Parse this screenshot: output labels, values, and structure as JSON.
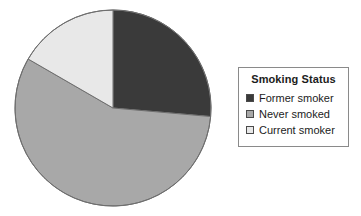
{
  "chart_data": {
    "type": "pie",
    "title": "",
    "legend_title": "Smoking Status",
    "legend_position": "right",
    "categories": [
      "Former smoker",
      "Never smoked",
      "Current smoker"
    ],
    "values": [
      26,
      57,
      17
    ],
    "unit": "percent",
    "slice_colors": [
      "#3a3a3a",
      "#a8a8a8",
      "#e8e8e8"
    ],
    "start_angle_deg": 0,
    "direction": "clockwise",
    "slices": [
      {
        "label": "Former smoker",
        "value": 26,
        "color": "#3a3a3a",
        "start_deg": 0,
        "end_deg": 95
      },
      {
        "label": "Never smoked",
        "value": 57,
        "color": "#a8a8a8",
        "start_deg": 95,
        "end_deg": 300
      },
      {
        "label": "Current smoker",
        "value": 17,
        "color": "#e8e8e8",
        "start_deg": 300,
        "end_deg": 360
      }
    ],
    "xlabel": "",
    "ylabel": "",
    "grid": false
  },
  "legend": {
    "title": "Smoking Status",
    "items": [
      {
        "label": "Former smoker",
        "color": "#3a3a3a"
      },
      {
        "label": "Never smoked",
        "color": "#a8a8a8"
      },
      {
        "label": "Current smoker",
        "color": "#e8e8e8"
      }
    ]
  },
  "pie": {
    "center_x": 113,
    "center_y": 108,
    "radius": 98,
    "outline_color": "#6e6e6e"
  }
}
